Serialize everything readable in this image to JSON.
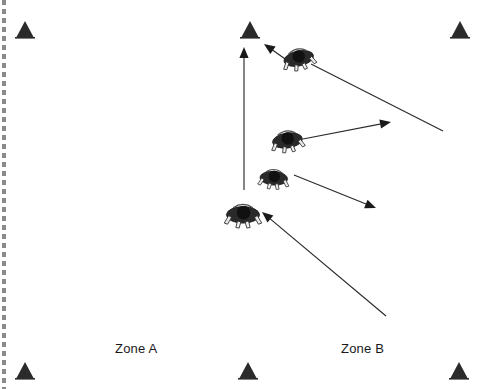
{
  "diagram": {
    "background_color": "#ffffff",
    "ink_color": "#1a1a1a",
    "width": 489,
    "height": 389
  },
  "labels": {
    "zone_a": "Zone A",
    "zone_b": "Zone B"
  },
  "binding_edge": {
    "name": "spiral-binding-edge",
    "x": 4,
    "dash_color": "#8a8a8a",
    "dash_length": 5,
    "gap_length": 4
  },
  "cones": [
    {
      "id": "cone-top-left",
      "x": 25,
      "y": 30,
      "size": 13
    },
    {
      "id": "cone-top-center",
      "x": 250,
      "y": 30,
      "size": 13
    },
    {
      "id": "cone-top-right",
      "x": 460,
      "y": 30,
      "size": 13
    },
    {
      "id": "cone-bottom-left",
      "x": 25,
      "y": 371,
      "size": 13
    },
    {
      "id": "cone-bottom-center",
      "x": 248,
      "y": 371,
      "size": 13
    },
    {
      "id": "cone-bottom-right",
      "x": 459,
      "y": 371,
      "size": 13
    }
  ],
  "players": [
    {
      "id": "player-top",
      "x": 298,
      "y": 55,
      "scale": 1.0,
      "rotation": -12
    },
    {
      "id": "player-middle",
      "x": 287,
      "y": 137,
      "scale": 1.0,
      "rotation": -8
    },
    {
      "id": "player-lower-middle",
      "x": 274,
      "y": 175,
      "scale": 0.92,
      "rotation": 4
    },
    {
      "id": "player-bottom",
      "x": 243,
      "y": 211,
      "scale": 1.1,
      "rotation": 0
    }
  ],
  "arrows": [
    {
      "id": "arrow-vertical-run",
      "from": [
        244,
        190
      ],
      "to": [
        244,
        47
      ],
      "head_at": "to"
    },
    {
      "id": "arrow-top-player-to-cone",
      "from": [
        288,
        61
      ],
      "to": [
        264,
        44
      ],
      "head_at": "to"
    },
    {
      "id": "arrow-incoming-top-right",
      "from": [
        443,
        131
      ],
      "to": [
        311,
        64
      ],
      "head_at": "none"
    },
    {
      "id": "arrow-middle-player-upright",
      "from": [
        303,
        139
      ],
      "to": [
        391,
        122
      ],
      "head_at": "to"
    },
    {
      "id": "arrow-lower-middle-downright",
      "from": [
        294,
        175
      ],
      "to": [
        376,
        208
      ],
      "head_at": "to"
    },
    {
      "id": "arrow-long-incoming-bottom-right",
      "from": [
        386,
        316
      ],
      "to": [
        262,
        212
      ],
      "head_at": "to"
    }
  ]
}
